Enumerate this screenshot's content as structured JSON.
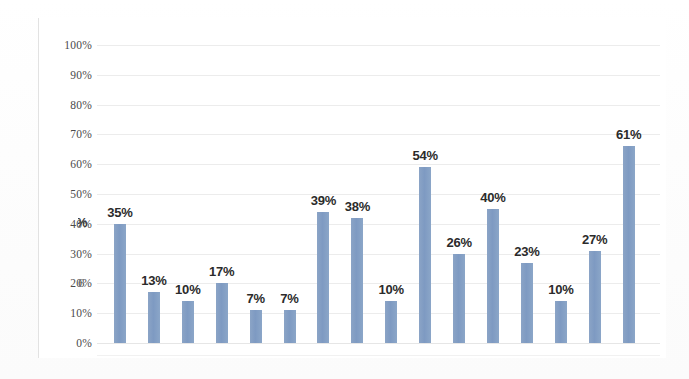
{
  "chart_data": {
    "type": "bar",
    "title": "",
    "subtitle": "",
    "xlabel": "",
    "ylabel": "",
    "ylim": [
      0,
      100
    ],
    "y_unit": "%",
    "grid": true,
    "legend": "none",
    "y_ticks": [
      "0%",
      "10%",
      "20%",
      "30%",
      "40%",
      "50%",
      "60%",
      "70%",
      "80%",
      "90%",
      "100%"
    ],
    "y_tick_values": [
      0,
      10,
      20,
      30,
      40,
      50,
      60,
      70,
      80,
      90,
      100
    ],
    "categories": [
      "",
      "",
      "",
      "",
      "",
      "",
      "",
      "",
      "",
      "",
      "",
      "",
      "",
      "",
      "",
      ""
    ],
    "values": [
      35,
      13,
      10,
      17,
      7,
      7,
      39,
      38,
      10,
      54,
      26,
      40,
      23,
      10,
      27,
      61
    ],
    "data_labels": [
      "35%",
      "13%",
      "10%",
      "17%",
      "7%",
      "7%",
      "39%",
      "38%",
      "10%",
      "54%",
      "26%",
      "40%",
      "23%",
      "10%",
      "27%",
      "61%"
    ],
    "bar_pixel_percents": [
      40,
      17,
      14,
      20,
      11,
      11,
      44,
      42,
      14,
      59,
      30,
      45,
      27,
      14,
      31,
      66
    ],
    "series": [
      {
        "name": "",
        "values": [
          35,
          13,
          10,
          17,
          7,
          7,
          39,
          38,
          10,
          54,
          26,
          40,
          23,
          10,
          27,
          61
        ]
      }
    ],
    "colors": {
      "bar": "#7e9ac2",
      "gridline": "#ececec",
      "label_text": "#2b2b2b",
      "axis_text": "#4a4a4a",
      "plot_background": "#ffffff"
    },
    "notes": {
      "cropped_left_label_percent": "%",
      "cropped_left_label_digit": "6"
    }
  }
}
